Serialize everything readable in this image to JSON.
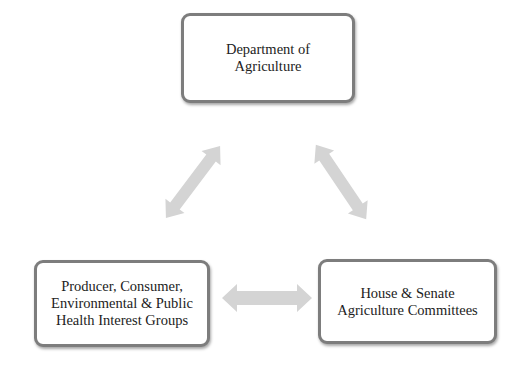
{
  "diagram": {
    "type": "iron-triangle",
    "nodes": {
      "top": {
        "lines": [
          "Department of",
          "Agriculture"
        ]
      },
      "left": {
        "lines": [
          "Producer, Consumer,",
          "Environmental & Public",
          "Health Interest Groups"
        ]
      },
      "right": {
        "lines": [
          "House & Senate",
          "Agriculture Committees"
        ]
      }
    },
    "edges": [
      {
        "from": "top",
        "to": "left",
        "style": "double-arrow"
      },
      {
        "from": "top",
        "to": "right",
        "style": "double-arrow"
      },
      {
        "from": "left",
        "to": "right",
        "style": "double-arrow"
      }
    ],
    "colors": {
      "border": "#7d7d7d",
      "arrow": "#d4d4d4",
      "text": "#222222"
    }
  }
}
